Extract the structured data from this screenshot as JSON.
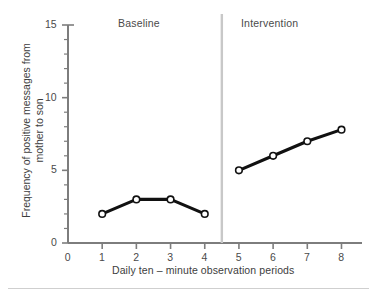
{
  "chart_data": {
    "type": "line",
    "title": "",
    "xlabel": "Daily ten – minute observation periods",
    "ylabel_line1": "Frequency of positive messages from",
    "ylabel_line2": "mother to son",
    "x": [
      1,
      2,
      3,
      4,
      5,
      6,
      7,
      8
    ],
    "xlim": [
      0,
      8.6
    ],
    "ylim": [
      0,
      15
    ],
    "xticks": [
      "0",
      "1",
      "2",
      "3",
      "4",
      "5",
      "6",
      "7",
      "8"
    ],
    "xtick_values": [
      0,
      1,
      2,
      3,
      4,
      5,
      6,
      7,
      8
    ],
    "yticks_major": [
      "0",
      "5",
      "10",
      "15"
    ],
    "ytick_major_values": [
      0,
      5,
      10,
      15
    ],
    "ytick_minor_values": [
      1,
      2,
      3,
      4,
      6,
      7,
      8,
      9,
      11,
      12,
      13,
      14
    ],
    "grid": false,
    "legend": "none",
    "marker": "open-circle",
    "series": [
      {
        "name": "Baseline",
        "x": [
          1,
          2,
          3,
          4
        ],
        "values": [
          2,
          3,
          3,
          2
        ]
      },
      {
        "name": "Intervention",
        "x": [
          5,
          6,
          7,
          8
        ],
        "values": [
          5,
          6,
          7,
          7.8
        ]
      }
    ],
    "phase_divider_x": 4.5,
    "annotations": [
      {
        "text": "Baseline",
        "x": 2.2,
        "y": 14.6
      },
      {
        "text": "Intervention",
        "x": 6.3,
        "y": 14.6
      }
    ],
    "colors": {
      "line": "#111111",
      "marker_fill": "#ffffff",
      "marker_stroke": "#111111",
      "axis": "#7d7d7d",
      "divider": "#c8c8c8",
      "text": "#3d3d3d",
      "background": "#ffffff",
      "bottom_rule": "#cfcfcf"
    }
  },
  "phases": {
    "baseline": "Baseline",
    "intervention": "Intervention"
  },
  "axes": {
    "x_title": "Daily ten – minute observation periods",
    "y_title_line1": "Frequency of positive messages from",
    "y_title_line2": "mother to son",
    "x_ticks": [
      "0",
      "1",
      "2",
      "3",
      "4",
      "5",
      "6",
      "7",
      "8"
    ],
    "y_ticks": [
      "15",
      "10",
      "5",
      "0"
    ]
  }
}
